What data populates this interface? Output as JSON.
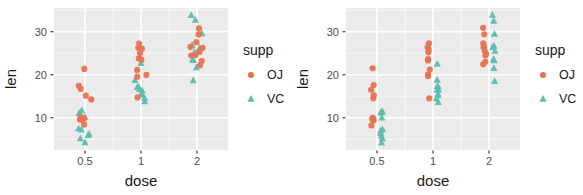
{
  "figure": {
    "panels": [
      {
        "name": "left-panel",
        "jitter": true,
        "axis": {
          "x": {
            "label": "dose",
            "ticks": [
              "0.5",
              "1",
              "2"
            ],
            "values": [
              0.5,
              1,
              2
            ]
          },
          "y": {
            "label": "len",
            "ticks": [
              "10",
              "20",
              "30"
            ],
            "values": [
              10,
              20,
              30
            ],
            "range": [
              2.5,
              35.5
            ]
          }
        },
        "legend": {
          "title": "supp",
          "items": [
            {
              "label": "OJ",
              "color": "#e8734f",
              "shape": "circle"
            },
            {
              "label": "VC",
              "color": "#5dbcb0",
              "shape": "triangle"
            }
          ]
        }
      },
      {
        "name": "right-panel",
        "jitter": false,
        "axis": {
          "x": {
            "label": "dose",
            "ticks": [
              "0.5",
              "1",
              "2"
            ],
            "values": [
              0.5,
              1,
              2
            ]
          },
          "y": {
            "label": "len",
            "ticks": [
              "10",
              "20",
              "30"
            ],
            "values": [
              10,
              20,
              30
            ],
            "range": [
              2.5,
              35.5
            ]
          }
        },
        "legend": {
          "title": "supp",
          "items": [
            {
              "label": "OJ",
              "color": "#e8734f",
              "shape": "circle"
            },
            {
              "label": "VC",
              "color": "#5dbcb0",
              "shape": "triangle"
            }
          ]
        }
      }
    ]
  },
  "chart_data": {
    "type": "scatter",
    "title": "",
    "xlabel": "dose",
    "ylabel": "len",
    "xticks": [
      "0.5",
      "1",
      "2"
    ],
    "yticks": [
      "10",
      "20",
      "30"
    ],
    "ylim": [
      2.5,
      35.5
    ],
    "grid": true,
    "legend": {
      "title": "supp",
      "position": "right",
      "entries": [
        "OJ",
        "VC"
      ]
    },
    "colors": {
      "OJ": "#e8734f",
      "VC": "#5dbcb0"
    },
    "shapes": {
      "OJ": "circle",
      "VC": "triangle"
    },
    "series": [
      {
        "name": "VC",
        "color": "#5dbcb0",
        "shape": "triangle",
        "points": [
          {
            "dose": 0.5,
            "len": 4.2
          },
          {
            "dose": 0.5,
            "len": 11.5
          },
          {
            "dose": 0.5,
            "len": 7.3
          },
          {
            "dose": 0.5,
            "len": 5.8
          },
          {
            "dose": 0.5,
            "len": 6.4
          },
          {
            "dose": 0.5,
            "len": 10.0
          },
          {
            "dose": 0.5,
            "len": 11.2
          },
          {
            "dose": 0.5,
            "len": 11.2
          },
          {
            "dose": 0.5,
            "len": 5.2
          },
          {
            "dose": 0.5,
            "len": 7.0
          },
          {
            "dose": 1,
            "len": 16.5
          },
          {
            "dose": 1,
            "len": 16.5
          },
          {
            "dose": 1,
            "len": 15.2
          },
          {
            "dose": 1,
            "len": 17.3
          },
          {
            "dose": 1,
            "len": 22.5
          },
          {
            "dose": 1,
            "len": 17.3
          },
          {
            "dose": 1,
            "len": 13.6
          },
          {
            "dose": 1,
            "len": 14.5
          },
          {
            "dose": 1,
            "len": 18.8
          },
          {
            "dose": 1,
            "len": 15.5
          },
          {
            "dose": 2,
            "len": 23.6
          },
          {
            "dose": 2,
            "len": 18.5
          },
          {
            "dose": 2,
            "len": 33.9
          },
          {
            "dose": 2,
            "len": 25.5
          },
          {
            "dose": 2,
            "len": 26.4
          },
          {
            "dose": 2,
            "len": 32.5
          },
          {
            "dose": 2,
            "len": 26.7
          },
          {
            "dose": 2,
            "len": 21.5
          },
          {
            "dose": 2,
            "len": 23.3
          },
          {
            "dose": 2,
            "len": 29.5
          }
        ]
      },
      {
        "name": "OJ",
        "color": "#e8734f",
        "shape": "circle",
        "points": [
          {
            "dose": 0.5,
            "len": 15.2
          },
          {
            "dose": 0.5,
            "len": 21.5
          },
          {
            "dose": 0.5,
            "len": 17.6
          },
          {
            "dose": 0.5,
            "len": 9.7
          },
          {
            "dose": 0.5,
            "len": 14.5
          },
          {
            "dose": 0.5,
            "len": 10.0
          },
          {
            "dose": 0.5,
            "len": 8.2
          },
          {
            "dose": 0.5,
            "len": 9.4
          },
          {
            "dose": 0.5,
            "len": 16.5
          },
          {
            "dose": 0.5,
            "len": 9.7
          },
          {
            "dose": 1,
            "len": 19.7
          },
          {
            "dose": 1,
            "len": 23.3
          },
          {
            "dose": 1,
            "len": 23.6
          },
          {
            "dose": 1,
            "len": 26.4
          },
          {
            "dose": 1,
            "len": 20.0
          },
          {
            "dose": 1,
            "len": 25.2
          },
          {
            "dose": 1,
            "len": 25.8
          },
          {
            "dose": 1,
            "len": 21.2
          },
          {
            "dose": 1,
            "len": 14.5
          },
          {
            "dose": 1,
            "len": 27.3
          },
          {
            "dose": 2,
            "len": 25.5
          },
          {
            "dose": 2,
            "len": 26.4
          },
          {
            "dose": 2,
            "len": 22.4
          },
          {
            "dose": 2,
            "len": 24.5
          },
          {
            "dose": 2,
            "len": 24.8
          },
          {
            "dose": 2,
            "len": 30.9
          },
          {
            "dose": 2,
            "len": 26.4
          },
          {
            "dose": 2,
            "len": 27.3
          },
          {
            "dose": 2,
            "len": 29.4
          },
          {
            "dose": 2,
            "len": 23.0
          }
        ]
      }
    ]
  },
  "style": {
    "panel_bg": "#ebebeb",
    "grid_major": "#ffffff",
    "grid_minor": "#f7f7f7",
    "text_color": "#1a1a1a",
    "tick_color": "#4d4d4d"
  }
}
